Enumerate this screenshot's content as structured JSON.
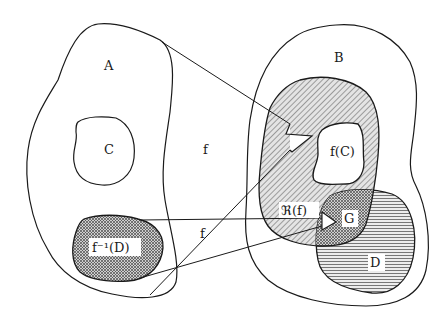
{
  "diagram": {
    "labels": {
      "A": "A",
      "B": "B",
      "C": "C",
      "f_top": "f",
      "f_bottom": "f",
      "fC": "f(C)",
      "preimage": "f⁻¹(D)",
      "range": "ℜ(f)",
      "G": "G",
      "D": "D"
    },
    "regions": [
      {
        "id": "A",
        "description": "domain set",
        "fill": "none"
      },
      {
        "id": "C",
        "description": "subset of A",
        "fill": "none"
      },
      {
        "id": "f^-1(D)",
        "description": "preimage of D in A",
        "fill": "crosshatch"
      },
      {
        "id": "B",
        "description": "codomain set",
        "fill": "none"
      },
      {
        "id": "R(f)",
        "description": "range of f in B",
        "fill": "diagonal-hatch"
      },
      {
        "id": "f(C)",
        "description": "image of C",
        "fill": "white"
      },
      {
        "id": "D",
        "description": "subset of B",
        "fill": "horizontal-hatch"
      },
      {
        "id": "G",
        "description": "intersection of R(f) and D",
        "fill": "crosshatch"
      }
    ],
    "arrows": [
      {
        "from": "A",
        "to": "R(f)",
        "label": "f"
      },
      {
        "from": "f^-1(D)",
        "to": "G",
        "label": "f"
      }
    ],
    "colors": {
      "stroke": "#1a1a1a",
      "hatch": "#555555",
      "background": "#ffffff"
    }
  }
}
